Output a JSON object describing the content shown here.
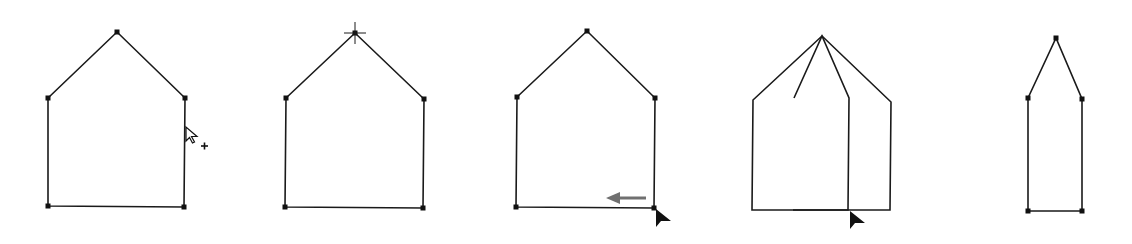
{
  "diagram": {
    "colors": {
      "stroke": "#1a1a1a",
      "anchor": "#111111",
      "arrow": "#707070",
      "cursor": "#111111"
    },
    "panels": [
      {
        "id": "step-1-add-anchor-cursor",
        "points": [
          [
            48,
            98
          ],
          [
            117,
            32
          ],
          [
            185,
            98
          ],
          [
            184,
            207
          ],
          [
            48,
            206
          ]
        ],
        "anchors": true,
        "cursor": {
          "type": "pen-add-anchor",
          "x": 186,
          "y": 127
        }
      },
      {
        "id": "step-2-select-apex",
        "points": [
          [
            286,
            98
          ],
          [
            355,
            33
          ],
          [
            424,
            99
          ],
          [
            423,
            208
          ],
          [
            285,
            207
          ]
        ],
        "anchors": true,
        "crosshair": {
          "x": 355,
          "y": 33
        }
      },
      {
        "id": "step-3-drag-left",
        "points": [
          [
            517,
            97
          ],
          [
            587,
            31
          ],
          [
            655,
            98
          ],
          [
            654,
            208
          ],
          [
            516,
            207
          ]
        ],
        "anchors": true,
        "drag_arrow": {
          "from": [
            646,
            198
          ],
          "to": [
            606,
            198
          ]
        },
        "cursor": {
          "type": "arrow",
          "x": 656,
          "y": 209
        }
      },
      {
        "id": "step-4-dragging",
        "outer": [
          [
            753,
            100
          ],
          [
            822,
            36
          ],
          [
            891,
            102
          ],
          [
            890,
            210
          ],
          [
            752,
            210
          ]
        ],
        "inner": [
          [
            794,
            98
          ],
          [
            822,
            36
          ],
          [
            849,
            98
          ],
          [
            848,
            210
          ],
          [
            793,
            210
          ]
        ],
        "anchors": false,
        "cursor": {
          "type": "arrow",
          "x": 850,
          "y": 211
        }
      },
      {
        "id": "step-5-result",
        "points": [
          [
            1028,
            98
          ],
          [
            1056,
            38
          ],
          [
            1082,
            99
          ],
          [
            1082,
            211
          ],
          [
            1028,
            211
          ]
        ],
        "anchors": true
      }
    ]
  }
}
